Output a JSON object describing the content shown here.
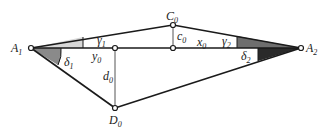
{
  "diagram": {
    "points": [
      {
        "id": "A1",
        "label": "A",
        "sub": "1",
        "x": 31,
        "y": 48,
        "lx": 11,
        "ly": 52
      },
      {
        "id": "A2",
        "label": "A",
        "sub": "2",
        "x": 301,
        "y": 48,
        "lx": 306,
        "ly": 52
      },
      {
        "id": "C0",
        "label": "C",
        "sub": "0",
        "x": 173,
        "y": 25,
        "lx": 166,
        "ly": 20
      },
      {
        "id": "D0",
        "label": "D",
        "sub": "0",
        "x": 115,
        "y": 108,
        "lx": 109,
        "ly": 124
      },
      {
        "id": "P1",
        "label": "",
        "sub": "",
        "x": 115,
        "y": 48
      },
      {
        "id": "P2",
        "label": "",
        "sub": "",
        "x": 173,
        "y": 48
      }
    ],
    "segment_labels": [
      {
        "id": "y0",
        "label": "y",
        "sub": "0",
        "x": 92,
        "y": 60
      },
      {
        "id": "x0",
        "label": "x",
        "sub": "0",
        "x": 197,
        "y": 46
      },
      {
        "id": "c0",
        "label": "c",
        "sub": "0",
        "x": 177,
        "y": 40
      },
      {
        "id": "d0",
        "label": "d",
        "sub": "0",
        "x": 103,
        "y": 80
      }
    ],
    "angle_labels": [
      {
        "id": "gamma1",
        "label": "γ",
        "sub": "1",
        "x": 97,
        "y": 44
      },
      {
        "id": "delta1",
        "label": "δ",
        "sub": "1",
        "x": 64,
        "y": 66
      },
      {
        "id": "gamma2",
        "label": "γ",
        "sub": "2",
        "x": 229,
        "y": 45
      },
      {
        "id": "delta2",
        "label": "δ",
        "sub": "2",
        "x": 241,
        "y": 59
      }
    ],
    "colors": {
      "line": "#1a1a1a",
      "thin_line": "#555555",
      "gamma1_fill": "#d8d8d8",
      "delta1_fill": "#8a8a8a",
      "gamma2_fill": "#6e6e6e",
      "delta2_fill": "#2a2a2a"
    }
  }
}
